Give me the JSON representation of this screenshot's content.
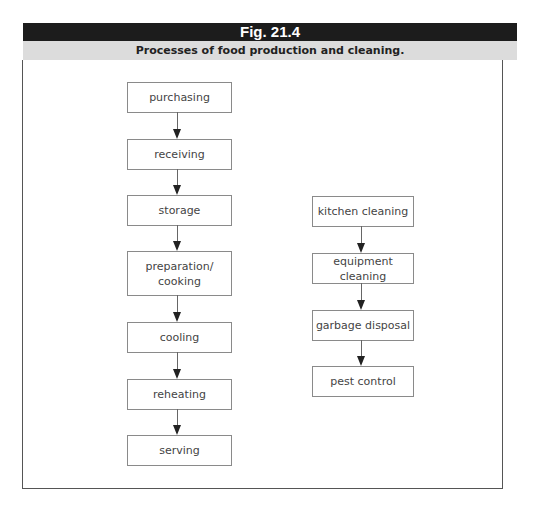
{
  "figure": {
    "label": "Fig. 21.4",
    "caption": "Processes of food production and cleaning."
  },
  "flows": {
    "food_production": {
      "steps": [
        {
          "label": "purchasing"
        },
        {
          "label": "receiving"
        },
        {
          "label": "storage"
        },
        {
          "label": "preparation/\ncooking"
        },
        {
          "label": "cooling"
        },
        {
          "label": "reheating"
        },
        {
          "label": "serving"
        }
      ]
    },
    "cleaning": {
      "steps": [
        {
          "label": "kitchen cleaning"
        },
        {
          "label": "equipment cleaning"
        },
        {
          "label": "garbage disposal"
        },
        {
          "label": "pest control"
        }
      ]
    }
  },
  "colors": {
    "header_bg": "#1c1c1c",
    "caption_bg": "#dcdcdc",
    "box_border": "#8a8a8a",
    "arrow": "#222222"
  }
}
